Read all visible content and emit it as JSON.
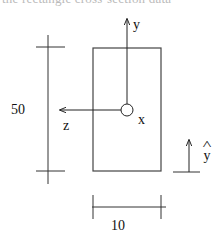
{
  "caption": {
    "text": "the rectangle cross-section data",
    "clipped": true
  },
  "figure": {
    "section": {
      "shape": "rectangle",
      "width": 10,
      "height": 50
    },
    "dimensions": {
      "height_label": "50",
      "width_label": "10"
    },
    "axes": {
      "y_label": "y",
      "z_label": "z",
      "x_label": "x",
      "x_axis_symbol": "circle (out of plane)"
    },
    "direction_indicator": {
      "label": "y",
      "hat": "^"
    },
    "colors": {
      "line": "#333333",
      "background": "#ffffff"
    }
  }
}
